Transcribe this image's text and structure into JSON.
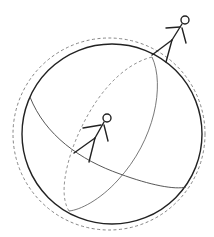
{
  "diagram": {
    "colors": {
      "background": "#ffffff",
      "stroke": "#222222",
      "thin_stroke": "#555555",
      "dashed": "#777777"
    },
    "elements": [
      {
        "type": "sphere-outline",
        "style": "solid"
      },
      {
        "type": "atmosphere-outline",
        "style": "dashed"
      },
      {
        "type": "great-circle-1",
        "style": "solid front / dashed back"
      },
      {
        "type": "great-circle-2",
        "style": "solid front / dashed back"
      },
      {
        "type": "stick-figure",
        "position": "top-right on sphere edge"
      },
      {
        "type": "stick-figure",
        "position": "center on great circle"
      }
    ]
  }
}
